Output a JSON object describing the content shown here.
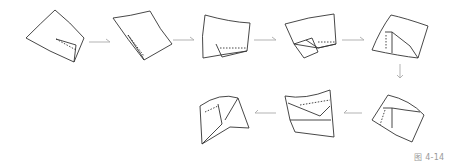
{
  "figure": {
    "caption": "图 4-14",
    "step_count": 8,
    "steps": [
      {
        "index": 1,
        "label": "step-1-square-corner-fold"
      },
      {
        "index": 2,
        "label": "step-2-rotated-square-side-fold"
      },
      {
        "index": 3,
        "label": "step-3-bottom-edge-fold"
      },
      {
        "index": 4,
        "label": "step-4-flap-folded-down"
      },
      {
        "index": 5,
        "label": "step-5-left-flap-raised"
      },
      {
        "index": 6,
        "label": "step-6-box-forming"
      },
      {
        "index": 7,
        "label": "step-7-pleated-form"
      },
      {
        "index": 8,
        "label": "step-8-final-shape"
      }
    ],
    "arrows": [
      "right",
      "right",
      "right",
      "right",
      "down",
      "left",
      "left"
    ],
    "colors": {
      "line": "#333333",
      "arrow": "#aaaaaa",
      "caption": "#9a9a9a"
    }
  }
}
